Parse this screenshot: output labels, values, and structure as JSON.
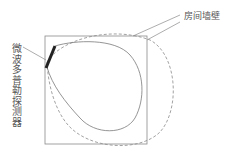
{
  "labels": {
    "wall": "房间墙壁",
    "detector": "微波多普勒探测器"
  },
  "colors": {
    "line": "#7a7a7a",
    "detector_bar": "#222222",
    "text": "#555555"
  },
  "elements": {
    "room": {
      "shape": "rectangle",
      "style": "solid"
    },
    "detection_pattern": {
      "shape": "teardrop",
      "style": "solid"
    },
    "coverage_area": {
      "shape": "ellipse",
      "style": "dashed"
    },
    "detector": {
      "shape": "thick-bar"
    }
  }
}
